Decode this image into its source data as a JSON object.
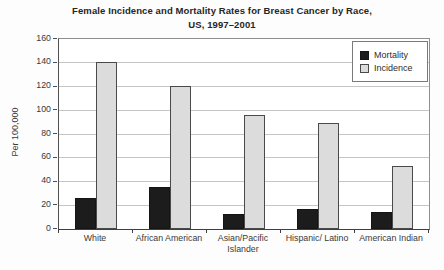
{
  "title": {
    "line1": "Female Incidence and Mortality Rates for Breast Cancer by Race,",
    "line2": "US, 1997–2001"
  },
  "chart_data": {
    "type": "bar",
    "title": "Female Incidence and Mortality Rates for Breast Cancer by Race, US, 1997–2001",
    "categories": [
      "White",
      "African American",
      "Asian/Pacific Islander",
      "Hispanic/ Latino",
      "American Indian"
    ],
    "series": [
      {
        "name": "Mortality",
        "color": "#1c1c1c",
        "values": [
          26,
          35,
          13,
          17,
          14
        ]
      },
      {
        "name": "Incidence",
        "color": "#dcdcdc",
        "values": [
          141,
          120,
          96,
          89,
          53
        ]
      }
    ],
    "xlabel": "",
    "ylabel": "Per 100,000",
    "ylim": [
      0,
      160
    ],
    "ytick_step": 20,
    "grid": true,
    "legend_position": "top-right"
  }
}
